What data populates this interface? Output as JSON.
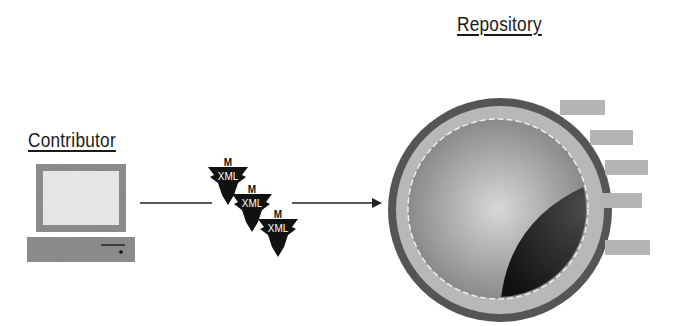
{
  "diagram": {
    "nodes": [
      {
        "id": "contributor",
        "label": "Contributor",
        "icon": "computer-icon"
      },
      {
        "id": "xml-docs",
        "label": "XML",
        "icon": "xml-document-icon",
        "count": 3
      },
      {
        "id": "repository",
        "label": "Repository",
        "icon": "repository-sphere-icon"
      }
    ],
    "edges": [
      {
        "from": "contributor",
        "to": "repository",
        "via": "xml-docs",
        "style": "arrow"
      }
    ]
  },
  "labels": {
    "contributor": "Contributor",
    "repository": "Repository",
    "xml_1": "XML",
    "xml_2": "XML",
    "xml_3": "XML"
  },
  "colors": {
    "outer_ring": "#555555",
    "ring_light": "#b4b4b4",
    "inner_disc": "#9a9a9a",
    "dark_wedge": "#1e1e1e",
    "screen": "#e4e4e4",
    "frame": "#8c8c8c"
  }
}
